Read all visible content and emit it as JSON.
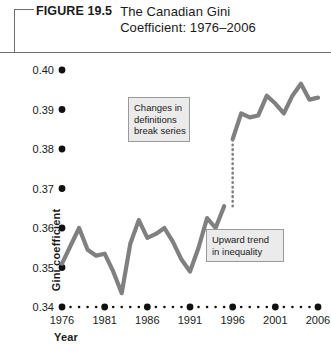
{
  "figure": {
    "label": "FIGURE 19.5",
    "title_line1": "The Canadian Gini",
    "title_line2": "Coefficient: 1976–2006"
  },
  "annotations": {
    "break": {
      "line1": "Changes in",
      "line2": "definitions",
      "line3": "break series"
    },
    "trend": {
      "line1": "Upward trend",
      "line2": "in inequality"
    }
  },
  "colors": {
    "line": "#808080",
    "axis_dot": "#111111",
    "annotation_fill": "#ebebeb",
    "annotation_border": "#9a9a9a",
    "rule": "#6e6e6e"
  },
  "chart_data": {
    "type": "line",
    "title": "The Canadian Gini Coefficient: 1976–2006",
    "xlabel": "Year",
    "ylabel": "Gini coefficient",
    "xlim": [
      1976,
      2006
    ],
    "ylim": [
      0.34,
      0.4
    ],
    "grid": false,
    "legend": false,
    "yticks": [
      "0.34",
      "0.35",
      "0.36",
      "0.37",
      "0.38",
      "0.39",
      "0.40"
    ],
    "ytick_values": [
      0.34,
      0.35,
      0.36,
      0.37,
      0.38,
      0.39,
      0.4
    ],
    "xticks": [
      "1976",
      "1981",
      "1986",
      "1991",
      "1996",
      "2001",
      "2006"
    ],
    "xtick_values": [
      1976,
      1981,
      1986,
      1991,
      1996,
      2001,
      2006
    ],
    "minor_x_values": [
      1977,
      1978,
      1979,
      1980,
      1982,
      1983,
      1984,
      1985,
      1987,
      1988,
      1989,
      1990,
      1992,
      1993,
      1994,
      1995,
      1997,
      1998,
      1999,
      2000,
      2002,
      2003,
      2004,
      2005
    ],
    "break_year": 1996,
    "break_from": 0.3655,
    "break_to": 0.3825,
    "series": [
      {
        "name": "Gini coefficient (old definition)",
        "x": [
          1976,
          1977,
          1978,
          1979,
          1980,
          1981,
          1982,
          1983,
          1984,
          1985,
          1986,
          1987,
          1988,
          1989,
          1990,
          1991,
          1992,
          1993,
          1994,
          1995
        ],
        "values": [
          0.351,
          0.3555,
          0.36,
          0.3545,
          0.353,
          0.3535,
          0.349,
          0.3435,
          0.356,
          0.362,
          0.3575,
          0.3585,
          0.36,
          0.3565,
          0.352,
          0.349,
          0.355,
          0.3625,
          0.36,
          0.3655
        ]
      },
      {
        "name": "Gini coefficient (new definition)",
        "x": [
          1996,
          1997,
          1998,
          1999,
          2000,
          2001,
          2002,
          2003,
          2004,
          2005,
          2006
        ],
        "values": [
          0.3825,
          0.389,
          0.388,
          0.3885,
          0.3935,
          0.3915,
          0.389,
          0.3935,
          0.3965,
          0.3925,
          0.393
        ]
      }
    ]
  }
}
